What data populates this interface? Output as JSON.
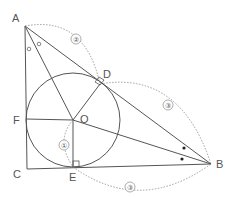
{
  "diagram": {
    "points": {
      "A": {
        "label": "A",
        "x": 25,
        "y": 26
      },
      "B": {
        "label": "B",
        "x": 211,
        "y": 164
      },
      "C": {
        "label": "C",
        "x": 27,
        "y": 169
      },
      "D": {
        "label": "D",
        "x": 100,
        "y": 84
      },
      "E": {
        "label": "E",
        "x": 73,
        "y": 167
      },
      "F": {
        "label": "F",
        "x": 26,
        "y": 119
      },
      "O": {
        "label": "O",
        "x": 73,
        "y": 120
      }
    },
    "incircle": {
      "center": "O",
      "radius": 47
    },
    "segment_labels": {
      "AD": "②",
      "DB": "③",
      "EB": "③",
      "OE": "①"
    },
    "angle_marks": {
      "A": "∘ ∘",
      "B": "• •"
    },
    "colors": {
      "line": "#555555",
      "dashed": "#888888"
    }
  }
}
